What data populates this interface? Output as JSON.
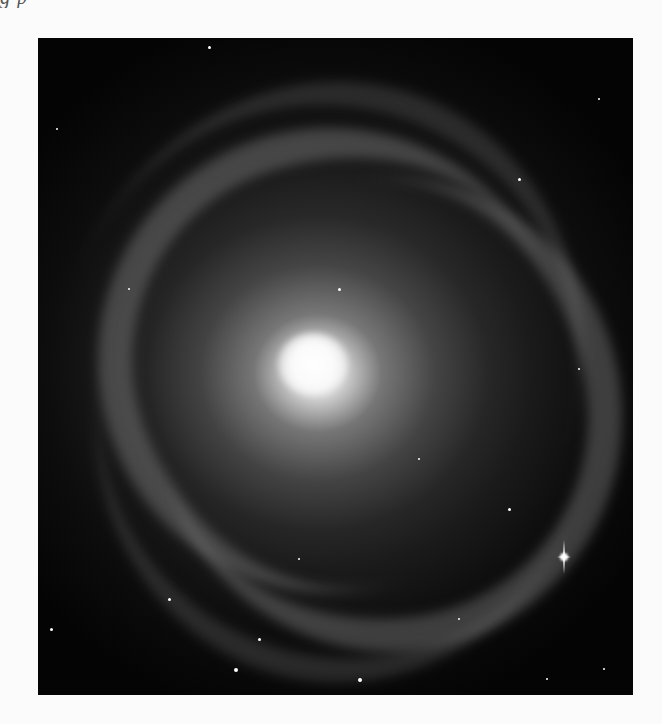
{
  "page": {
    "background": "#fbfbfb",
    "cutoff_text": "g    p"
  },
  "figure": {
    "style": "grayscale photograph",
    "frame": {
      "x": 38,
      "y": 38,
      "width": 595,
      "height": 657
    },
    "core_position": {
      "x": 315,
      "y": 370
    },
    "bright_star_position": {
      "x": 566,
      "y": 557
    },
    "colors": {
      "sky": "#040404",
      "core": "#ffffff",
      "arms": "#9a9a9a"
    }
  }
}
